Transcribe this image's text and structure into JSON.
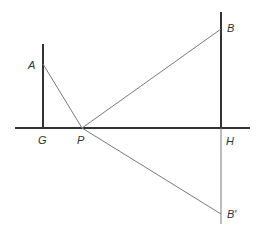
{
  "diagram": {
    "title": "",
    "labels": {
      "A": "A",
      "B": "B",
      "B_prime": "B′",
      "G": "G",
      "H": "H",
      "P": "P"
    },
    "segments": [
      {
        "name": "ground-line",
        "from": "left",
        "to": "right",
        "style": "thick"
      },
      {
        "name": "pole-GA",
        "from": "G",
        "to": "A",
        "style": "thick"
      },
      {
        "name": "pole-HB",
        "from": "H",
        "to": "B",
        "style": "thick"
      },
      {
        "name": "reflection-HB'",
        "from": "H",
        "to": "B′",
        "style": "thin"
      },
      {
        "name": "AP",
        "from": "A",
        "to": "P",
        "style": "thin"
      },
      {
        "name": "PB",
        "from": "P",
        "to": "B",
        "style": "thin"
      },
      {
        "name": "PB'",
        "from": "P",
        "to": "B′",
        "style": "thin"
      }
    ],
    "colors": {
      "thick_line": "#333333",
      "thin_line": "#7a7a7a",
      "label": "#333333"
    }
  }
}
